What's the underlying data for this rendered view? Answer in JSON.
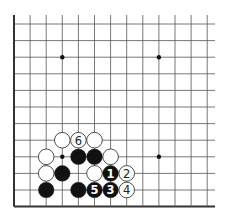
{
  "diagram": {
    "type": "go-board-fragment",
    "grid": {
      "columns": 13,
      "rows": 12,
      "origin_x": 14,
      "origin_y": 24,
      "spacing_x": 16.1,
      "spacing_y": 16.6,
      "top_open_y": 15,
      "right_open_x": 215,
      "edges": [
        "left",
        "bottom"
      ]
    },
    "colors": {
      "line": "#555555",
      "edge": "#333333",
      "black_stone": "#111111",
      "white_stone": "#ffffff",
      "white_stone_border": "#222222",
      "black_label": "#ffffff",
      "white_label": "#222222"
    },
    "star_points": [
      {
        "col": 3,
        "row": 2
      },
      {
        "col": 9,
        "row": 2
      },
      {
        "col": 3,
        "row": 8
      },
      {
        "col": 9,
        "row": 8
      }
    ],
    "stones": [
      {
        "color": "white",
        "col": 3,
        "row": 7,
        "label": ""
      },
      {
        "color": "white",
        "col": 4,
        "row": 7,
        "label": "6"
      },
      {
        "color": "white",
        "col": 5,
        "row": 7,
        "label": ""
      },
      {
        "color": "white",
        "col": 2,
        "row": 8,
        "label": ""
      },
      {
        "color": "black",
        "col": 4,
        "row": 8,
        "label": ""
      },
      {
        "color": "black",
        "col": 5,
        "row": 8,
        "label": ""
      },
      {
        "color": "white",
        "col": 6,
        "row": 8,
        "label": ""
      },
      {
        "color": "white",
        "col": 2,
        "row": 9,
        "label": ""
      },
      {
        "color": "black",
        "col": 3,
        "row": 9,
        "label": ""
      },
      {
        "color": "white",
        "col": 5,
        "row": 9,
        "label": ""
      },
      {
        "color": "black",
        "col": 6,
        "row": 9,
        "label": "1"
      },
      {
        "color": "white",
        "col": 7,
        "row": 9,
        "label": "2"
      },
      {
        "color": "black",
        "col": 2,
        "row": 10,
        "label": ""
      },
      {
        "color": "black",
        "col": 4,
        "row": 10,
        "label": ""
      },
      {
        "color": "black",
        "col": 5,
        "row": 10,
        "label": "5"
      },
      {
        "color": "black",
        "col": 6,
        "row": 10,
        "label": "3"
      },
      {
        "color": "white",
        "col": 7,
        "row": 10,
        "label": "4"
      }
    ],
    "caption": ""
  }
}
